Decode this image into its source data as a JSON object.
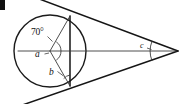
{
  "figure": {
    "type": "geometry-diagram",
    "canvas": {
      "width": 183,
      "height": 104,
      "background": "#ffffff"
    },
    "colors": {
      "stroke": "#151515",
      "circle_stroke": "#1a1a1a",
      "thin_stroke": "#3a3a3a",
      "arc_stroke": "#333333",
      "label_color": "#101010"
    },
    "circle": {
      "cx": 50,
      "cy": 51,
      "r": 36
    },
    "apex": {
      "x": 178,
      "y": 51
    },
    "tangent_points": {
      "top": {
        "x": 70,
        "y": 16
      },
      "bottom": {
        "x": 70,
        "y": 86
      }
    },
    "labels": {
      "angle_center_upper": "70°",
      "angle_center_lower": "a",
      "angle_chord_bottom": "b",
      "angle_apex": "c"
    },
    "label_positions": {
      "angle_center_upper": {
        "x": 33,
        "y": 33
      },
      "angle_center_lower": {
        "x": 38,
        "y": 55
      },
      "angle_chord_bottom": {
        "x": 51,
        "y": 73
      },
      "angle_apex": {
        "x": 140,
        "y": 45
      }
    },
    "corner_mark": {
      "present": true,
      "x": 0,
      "y": 0,
      "w": 5,
      "h": 10
    }
  }
}
